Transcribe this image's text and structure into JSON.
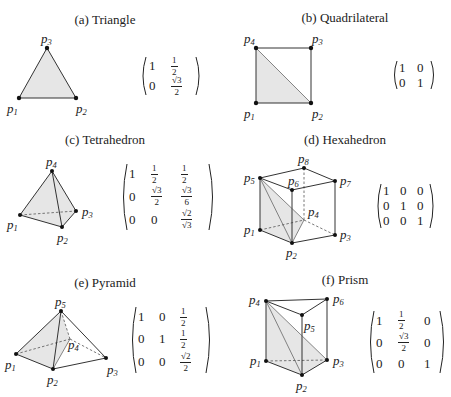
{
  "figure": {
    "panels": [
      {
        "id": "a",
        "title": "(a) Triangle",
        "vertices": [
          "p1",
          "p2",
          "p3"
        ],
        "matrix": [
          [
            "1",
            "1/2"
          ],
          [
            "0",
            "√3/2"
          ]
        ]
      },
      {
        "id": "b",
        "title": "(b) Quadrilateral",
        "vertices": [
          "p1",
          "p2",
          "p3",
          "p4"
        ],
        "matrix": [
          [
            "1",
            "0"
          ],
          [
            "0",
            "1"
          ]
        ]
      },
      {
        "id": "c",
        "title": "(c) Tetrahedron",
        "vertices": [
          "p1",
          "p2",
          "p3",
          "p4"
        ],
        "matrix": [
          [
            "1",
            "1/2",
            "1/2"
          ],
          [
            "0",
            "√3/2",
            "√3/6"
          ],
          [
            "0",
            "0",
            "√2/√3"
          ]
        ]
      },
      {
        "id": "d",
        "title": "(d) Hexahedron",
        "vertices": [
          "p1",
          "p2",
          "p3",
          "p4",
          "p5",
          "p6",
          "p7",
          "p8"
        ],
        "matrix": [
          [
            "1",
            "0",
            "0"
          ],
          [
            "0",
            "1",
            "0"
          ],
          [
            "0",
            "0",
            "1"
          ]
        ]
      },
      {
        "id": "e",
        "title": "(e) Pyramid",
        "vertices": [
          "p1",
          "p2",
          "p3",
          "p4",
          "p5"
        ],
        "matrix": [
          [
            "1",
            "0",
            "1/2"
          ],
          [
            "0",
            "1",
            "1/2"
          ],
          [
            "0",
            "0",
            "√2/2"
          ]
        ]
      },
      {
        "id": "f",
        "title": "(f) Prism",
        "vertices": [
          "p1",
          "p2",
          "p3",
          "p4",
          "p5",
          "p6"
        ],
        "matrix": [
          [
            "1",
            "1/2",
            "0"
          ],
          [
            "0",
            "√3/2",
            "0"
          ],
          [
            "0",
            "0",
            "1"
          ]
        ]
      }
    ],
    "labels": {
      "p": "p",
      "i1": "1",
      "i2": "2",
      "i3": "3",
      "i4": "4",
      "i5": "5",
      "i6": "6",
      "i7": "7",
      "i8": "8"
    },
    "matrix_text": {
      "one": "1",
      "zero": "0",
      "half_num": "1",
      "half_den": "2",
      "sqrt3": "√3",
      "sqrt2": "√2",
      "two": "2",
      "six": "6"
    },
    "colors": {
      "shade": "#e6e6e6",
      "edge": "#333333",
      "point": "#111111"
    }
  }
}
